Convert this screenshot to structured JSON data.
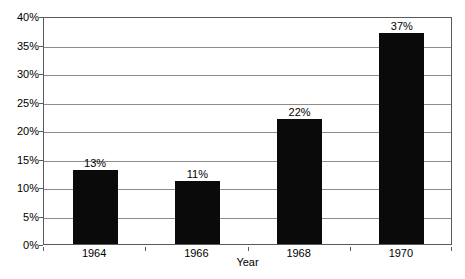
{
  "chart_data": {
    "type": "bar",
    "title": "",
    "subtitle": "",
    "xlabel": "Year",
    "ylabel": "",
    "categories": [
      "1964",
      "1966",
      "1968",
      "1970"
    ],
    "values": [
      13,
      11,
      22,
      37
    ],
    "data_labels": [
      "13%",
      "11%",
      "22%",
      "37%"
    ],
    "ylim": [
      0,
      40
    ],
    "ytick_values": [
      0,
      5,
      10,
      15,
      20,
      25,
      30,
      35,
      40
    ],
    "ytick_labels": [
      "0%",
      "5%",
      "10%",
      "15%",
      "20%",
      "25%",
      "30%",
      "35%",
      "40%"
    ],
    "grid": true,
    "grid_axis": "y",
    "legend": false,
    "legend_position": "none",
    "series": [
      {
        "name": "",
        "values": [
          13,
          11,
          22,
          37
        ],
        "color": "#0a0a0a"
      }
    ],
    "colors": {
      "bar": "#0a0a0a",
      "gridline": "#8d8d8d",
      "axis": "#5a5a5a",
      "text": "#000000",
      "background": "#ffffff"
    }
  }
}
